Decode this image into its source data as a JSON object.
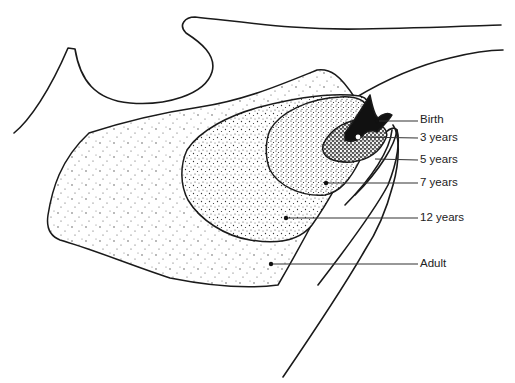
{
  "figure": {
    "colors": {
      "line": "#1a1a1a",
      "stipple": "#333333",
      "birth_fill": "#111111",
      "background": "#ffffff"
    },
    "labels": [
      {
        "id": "birth",
        "text": "Birth",
        "x": 420,
        "y": 120,
        "dot_x": 377,
        "dot_y": 121
      },
      {
        "id": "3-years",
        "text": "3 years",
        "x": 420,
        "y": 138,
        "dot_x": 358,
        "dot_y": 137
      },
      {
        "id": "5-years",
        "text": "5 years",
        "x": 420,
        "y": 160,
        "dot_x": 375,
        "dot_y": 159
      },
      {
        "id": "7-years",
        "text": "7 years",
        "x": 420,
        "y": 183,
        "dot_x": 326,
        "dot_y": 183
      },
      {
        "id": "12-years",
        "text": "12 years",
        "x": 420,
        "y": 218,
        "dot_x": 286,
        "dot_y": 218
      },
      {
        "id": "adult",
        "text": "Adult",
        "x": 420,
        "y": 264,
        "dot_x": 271,
        "dot_y": 264
      }
    ]
  }
}
